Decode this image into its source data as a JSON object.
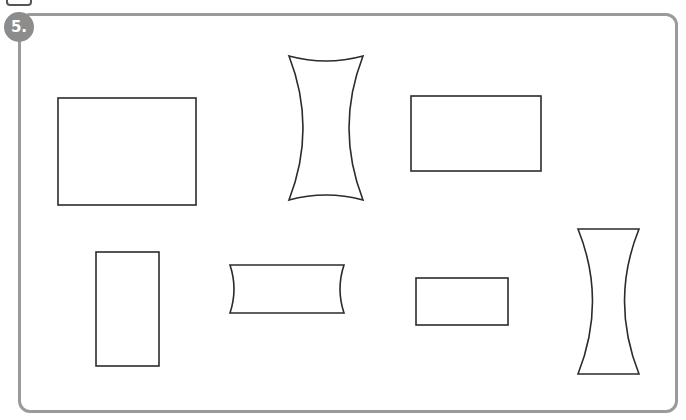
{
  "exercise": {
    "number_label": "5.",
    "badge_color": "#8c8c8c",
    "border_color": "#9a9a9a",
    "stroke_color": "#2b2b2b"
  },
  "shapes": [
    {
      "id": "rect-1",
      "type": "rectangle",
      "x": 58,
      "y": 98,
      "w": 138,
      "h": 107
    },
    {
      "id": "concave-1",
      "type": "concave-quad",
      "orientation": "vertical",
      "x": 288,
      "y": 55,
      "w": 76,
      "h": 146
    },
    {
      "id": "rect-2",
      "type": "rectangle",
      "x": 411,
      "y": 96,
      "w": 130,
      "h": 75
    },
    {
      "id": "rect-3",
      "type": "rectangle",
      "x": 96,
      "y": 252,
      "w": 63,
      "h": 114
    },
    {
      "id": "concave-2",
      "type": "concave-quad",
      "orientation": "horizontal-sides",
      "x": 229,
      "y": 265,
      "w": 115,
      "h": 48
    },
    {
      "id": "rect-4",
      "type": "rectangle",
      "x": 416,
      "y": 278,
      "w": 92,
      "h": 47
    },
    {
      "id": "concave-3",
      "type": "concave-quad",
      "orientation": "vertical-sides",
      "x": 578,
      "y": 229,
      "w": 61,
      "h": 145
    }
  ]
}
